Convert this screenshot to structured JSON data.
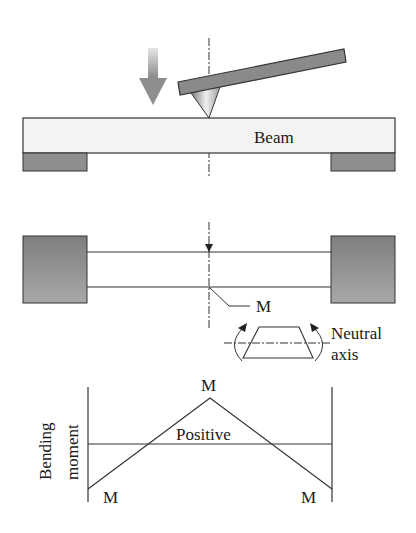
{
  "figure": {
    "panel_top": {
      "beam_label": "Beam"
    },
    "panel_middle": {
      "moment_label": "M",
      "neutral_axis_label_line1": "Neutral",
      "neutral_axis_label_line2": "axis"
    },
    "panel_bottom": {
      "y_axis_label_line1": "Bending",
      "y_axis_label_line2": "moment",
      "peak_label": "M",
      "left_end_label": "M",
      "right_end_label": "M",
      "region_label": "Positive"
    }
  },
  "colors": {
    "line": "#2a2a2a",
    "support_fill": "#8c8c8c",
    "beam_fill": "#f2f2f2",
    "rod_fill": "#8a8a8a"
  }
}
